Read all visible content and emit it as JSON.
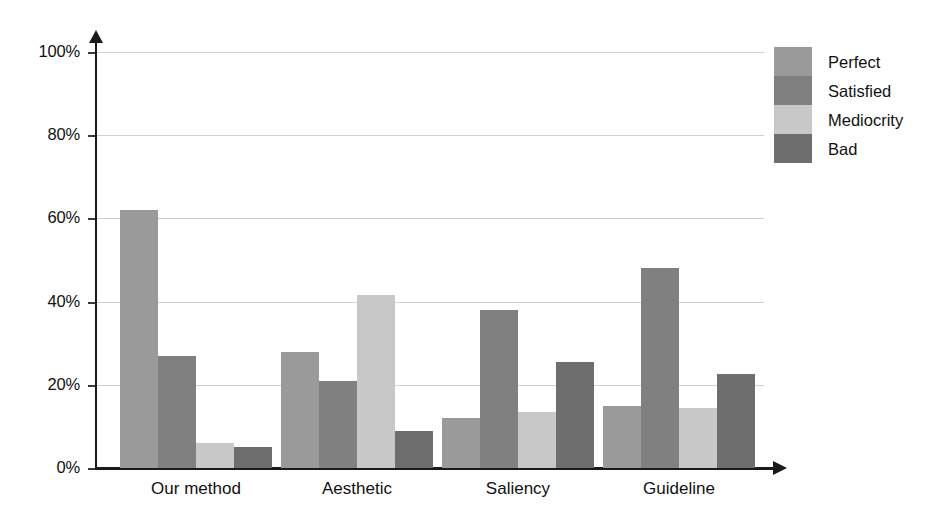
{
  "chart_data": {
    "type": "bar",
    "title": "",
    "xlabel": "",
    "ylabel": "",
    "ylim": [
      0,
      100
    ],
    "ytick_labels": [
      "0%",
      "20%",
      "40%",
      "60%",
      "80%",
      "100%"
    ],
    "ytick_values": [
      0,
      20,
      40,
      60,
      80,
      100
    ],
    "grid": true,
    "legend_position": "right",
    "categories": [
      "Our method",
      "Aesthetic",
      "Saliency",
      "Guideline"
    ],
    "series": [
      {
        "name": "Perfect",
        "color": "#9a9a9a",
        "values": [
          62,
          28,
          12,
          15
        ]
      },
      {
        "name": "Satisfied",
        "color": "#808080",
        "values": [
          27,
          21,
          38,
          48
        ]
      },
      {
        "name": "Mediocrity",
        "color": "#c8c8c8",
        "values": [
          6,
          41.5,
          13.5,
          14.5
        ]
      },
      {
        "name": "Bad",
        "color": "#6e6e6e",
        "values": [
          5,
          9,
          25.5,
          22.5
        ]
      }
    ]
  },
  "axes": {
    "y_ticks": [
      {
        "label": "100%",
        "value": 100
      },
      {
        "label": "80%",
        "value": 80
      },
      {
        "label": "60%",
        "value": 60
      },
      {
        "label": "40%",
        "value": 40
      },
      {
        "label": "20%",
        "value": 20
      },
      {
        "label": "0%",
        "value": 0
      }
    ]
  },
  "legend": {
    "items": [
      {
        "label": "Perfect",
        "color": "#9a9a9a"
      },
      {
        "label": "Satisfied",
        "color": "#808080"
      },
      {
        "label": "Mediocrity",
        "color": "#c8c8c8"
      },
      {
        "label": "Bad",
        "color": "#6e6e6e"
      }
    ]
  },
  "groups": [
    {
      "label": "Our method"
    },
    {
      "label": "Aesthetic"
    },
    {
      "label": "Saliency"
    },
    {
      "label": "Guideline"
    }
  ]
}
